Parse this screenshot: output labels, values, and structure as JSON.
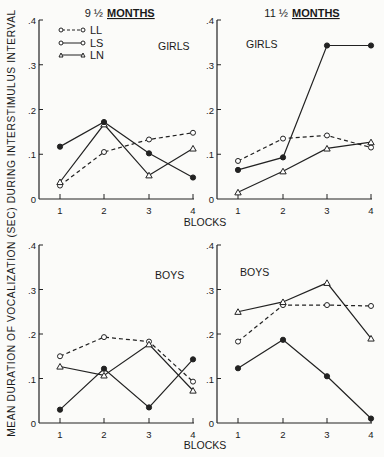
{
  "figure": {
    "ylabel": "MEAN DURATION OF VOCALIZATION (SEC) DURING INTERSTIMULUS INTERVAL",
    "xlabel": "BLOCKS",
    "col_titles": {
      "left_prefix": "9 ½",
      "left_underlined": "MONTHS",
      "right_prefix": "11 ½",
      "right_underlined": "MONTHS"
    },
    "legend": [
      {
        "label": "LL",
        "marker": "open-circle",
        "line": "dashed"
      },
      {
        "label": "LS",
        "marker": "filled-circle",
        "line": "solid"
      },
      {
        "label": "LN",
        "marker": "open-triangle",
        "line": "solid"
      }
    ],
    "yticks": [
      "0",
      ".1",
      ".2",
      ".3",
      ".4"
    ],
    "xticks": [
      "1",
      "2",
      "3",
      "4"
    ]
  },
  "chart_data": [
    {
      "type": "line",
      "title": "9½ MONTHS — GIRLS",
      "panel_label": "GIRLS",
      "x": [
        1,
        2,
        3,
        4
      ],
      "xlabel": "BLOCKS",
      "ylabel": "Mean duration of vocalization (sec) during interstimulus interval",
      "ylim": [
        0,
        0.4
      ],
      "series": [
        {
          "name": "LL",
          "values": [
            0.03,
            0.105,
            0.133,
            0.148
          ]
        },
        {
          "name": "LS",
          "values": [
            0.117,
            0.172,
            0.102,
            0.048
          ]
        },
        {
          "name": "LN",
          "values": [
            0.038,
            0.167,
            0.053,
            0.113
          ]
        }
      ]
    },
    {
      "type": "line",
      "title": "11½ MONTHS — GIRLS",
      "panel_label": "GIRLS",
      "x": [
        1,
        2,
        3,
        4
      ],
      "xlabel": "BLOCKS",
      "ylim": [
        0,
        0.4
      ],
      "series": [
        {
          "name": "LL",
          "values": [
            0.085,
            0.135,
            0.142,
            0.115
          ]
        },
        {
          "name": "LS",
          "values": [
            0.065,
            0.093,
            0.343,
            0.343
          ]
        },
        {
          "name": "LN",
          "values": [
            0.015,
            0.062,
            0.113,
            0.127
          ]
        }
      ]
    },
    {
      "type": "line",
      "title": "9½ MONTHS — BOYS",
      "panel_label": "BOYS",
      "x": [
        1,
        2,
        3,
        4
      ],
      "xlabel": "BLOCKS",
      "ylim": [
        0,
        0.4
      ],
      "series": [
        {
          "name": "LL",
          "values": [
            0.15,
            0.193,
            0.183,
            0.093
          ]
        },
        {
          "name": "LS",
          "values": [
            0.03,
            0.122,
            0.035,
            0.143
          ]
        },
        {
          "name": "LN",
          "values": [
            0.127,
            0.107,
            0.177,
            0.073
          ]
        }
      ]
    },
    {
      "type": "line",
      "title": "11½ MONTHS — BOYS",
      "panel_label": "BOYS",
      "x": [
        1,
        2,
        3,
        4
      ],
      "xlabel": "BLOCKS",
      "ylim": [
        0,
        0.4
      ],
      "series": [
        {
          "name": "LL",
          "values": [
            0.183,
            0.265,
            0.265,
            0.263
          ]
        },
        {
          "name": "LS",
          "values": [
            0.123,
            0.187,
            0.105,
            0.01
          ]
        },
        {
          "name": "LN",
          "values": [
            0.25,
            0.272,
            0.315,
            0.19
          ]
        }
      ]
    }
  ]
}
